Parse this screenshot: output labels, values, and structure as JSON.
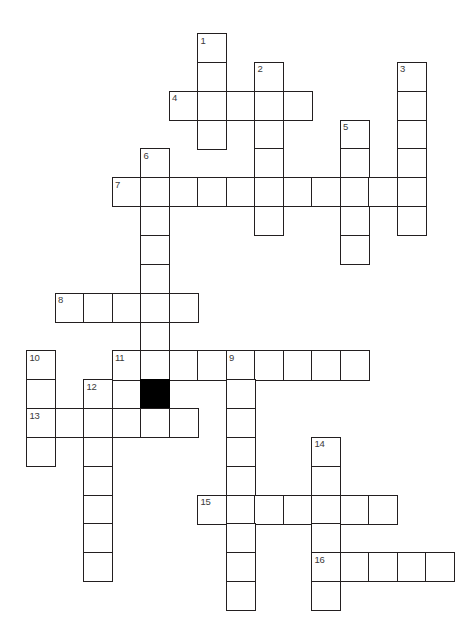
{
  "puzzle": {
    "title": "Crossword Puzzle Grid",
    "type": "crossword",
    "canvas": {
      "width": 476,
      "height": 623
    },
    "geometry": {
      "origin_x": 26,
      "origin_y": 33,
      "cell_width": 28.5,
      "cell_height": 28.85
    },
    "colors": {
      "background": "#ffffff",
      "cell_fill": "#ffffff",
      "cell_border": "#231f20",
      "blocked_fill": "#000000",
      "number_text": "#3a3a3a"
    },
    "grid": {
      "columns": 15,
      "rows": 20
    },
    "entries": [
      {
        "number": "1",
        "direction": "down",
        "col": 6,
        "row": 0,
        "length": 4
      },
      {
        "number": "2",
        "direction": "down",
        "col": 8,
        "row": 1,
        "length": 6
      },
      {
        "number": "3",
        "direction": "down",
        "col": 13,
        "row": 1,
        "length": 6
      },
      {
        "number": "4",
        "direction": "across",
        "col": 5,
        "row": 2,
        "length": 5
      },
      {
        "number": "5",
        "direction": "down",
        "col": 11,
        "row": 3,
        "length": 5
      },
      {
        "number": "6",
        "direction": "down",
        "col": 4,
        "row": 4,
        "length": 9
      },
      {
        "number": "7",
        "direction": "across",
        "col": 3,
        "row": 5,
        "length": 11
      },
      {
        "number": "8",
        "direction": "across",
        "col": 1,
        "row": 9,
        "length": 5
      },
      {
        "number": "9",
        "direction": "down",
        "col": 7,
        "row": 11,
        "length": 9
      },
      {
        "number": "10",
        "direction": "down",
        "col": 0,
        "row": 11,
        "length": 4
      },
      {
        "number": "11",
        "direction": "across",
        "col": 3,
        "row": 11,
        "length": 9
      },
      {
        "number": "12",
        "direction": "down",
        "col": 2,
        "row": 12,
        "length": 7
      },
      {
        "number": "13",
        "direction": "across",
        "col": 0,
        "row": 13,
        "length": 6
      },
      {
        "number": "14",
        "direction": "down",
        "col": 10,
        "row": 14,
        "length": 6
      },
      {
        "number": "15",
        "direction": "across",
        "col": 6,
        "row": 16,
        "length": 7
      },
      {
        "number": "16",
        "direction": "across",
        "col": 10,
        "row": 18,
        "length": 5
      }
    ],
    "blocked_cells": [
      {
        "col": 4,
        "row": 12
      }
    ]
  }
}
